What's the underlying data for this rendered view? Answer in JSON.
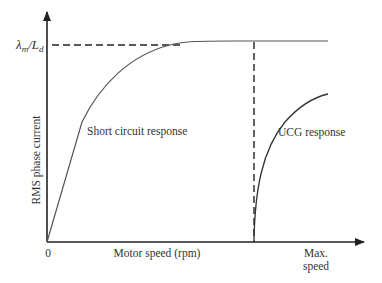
{
  "diagram": {
    "y_axis_label": "RMS phase current",
    "x_axis_label": "Motor speed (rpm)",
    "origin_label": "0",
    "y_level_label_main": "λ",
    "y_level_label_sub1": "m",
    "y_level_label_slash": "/L",
    "y_level_label_sub2": "d",
    "max_speed_label_line1": "Max.",
    "max_speed_label_line2": "speed",
    "curves": [
      {
        "name": "short-circuit-response",
        "label": "Short circuit response"
      },
      {
        "name": "ucg-response",
        "label": "UCG response"
      }
    ],
    "colors": {
      "axis": "#222222",
      "curve": "#555555",
      "text": "#333333"
    }
  }
}
